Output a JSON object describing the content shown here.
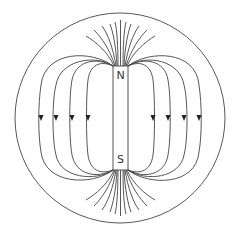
{
  "diagram": {
    "magnet": {
      "north_label": "N",
      "south_label": "S",
      "x": 113,
      "y": 66,
      "width": 15,
      "height": 104
    },
    "outer_circle": {
      "cx": 120,
      "cy": 118,
      "rx": 105,
      "ry": 105
    },
    "field_loops": {
      "count_per_side": 4,
      "arrow_direction": "down",
      "arrow_y": 118,
      "left_arrow_x": [
        41,
        56,
        72,
        88
      ],
      "right_arrow_x": [
        153,
        168,
        184,
        199
      ]
    },
    "pole_fan_lines": {
      "per_pole": 11
    },
    "colors": {
      "line": "#444444",
      "background": "#ffffff",
      "text": "#333333"
    }
  }
}
